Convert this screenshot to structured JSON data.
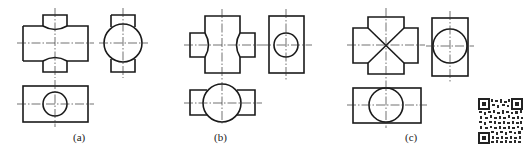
{
  "figure": {
    "colors": {
      "line": "#1a1a1a",
      "center_line": "#333333",
      "background": "#ffffff"
    },
    "panels": [
      {
        "id": "a",
        "label": "(a)",
        "views": [
          "front",
          "side",
          "top"
        ]
      },
      {
        "id": "b",
        "label": "(b)",
        "views": [
          "front",
          "side",
          "top"
        ]
      },
      {
        "id": "c",
        "label": "(c)",
        "views": [
          "front",
          "side",
          "top"
        ]
      }
    ],
    "qr_code": {
      "visible": true
    }
  }
}
